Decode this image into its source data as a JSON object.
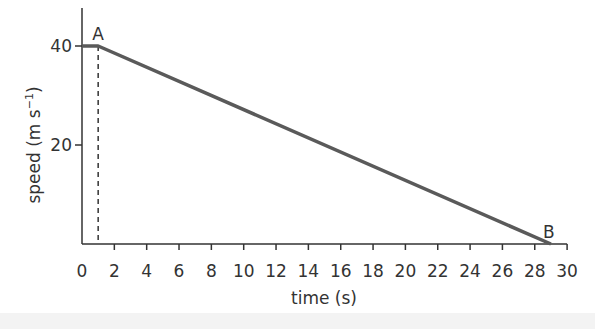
{
  "chart_data": {
    "type": "line",
    "title": "",
    "xlabel": "time (s)",
    "ylabel": "speed (m s⁻¹)",
    "ylabel_parts": {
      "main": "speed (m s",
      "sup": "−1",
      "close": ")"
    },
    "xlim": [
      0,
      30
    ],
    "ylim": [
      0,
      48
    ],
    "x_ticks": [
      0,
      2,
      4,
      6,
      8,
      10,
      12,
      14,
      16,
      18,
      20,
      22,
      24,
      26,
      28,
      30
    ],
    "y_ticks": [
      20,
      40
    ],
    "grid": false,
    "legend": null,
    "series": [
      {
        "name": "speed",
        "x": [
          0,
          1,
          29
        ],
        "y": [
          40,
          40,
          0
        ],
        "color": "#5a5a5a"
      }
    ],
    "annotations": [
      {
        "label": "A",
        "x": 1,
        "y": 40
      },
      {
        "label": "B",
        "x": 29,
        "y": 0
      }
    ],
    "reference_lines": [
      {
        "type": "vertical-dashed",
        "x": 1,
        "y_from": 0,
        "y_to": 40
      }
    ]
  },
  "colors": {
    "axis": "#333333",
    "line": "#5a5a5a",
    "text": "#333333",
    "band": "#f3f3f3"
  }
}
